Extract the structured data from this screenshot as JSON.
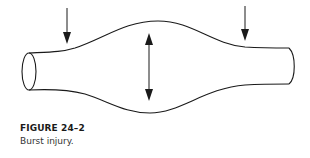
{
  "figure": {
    "label": "FIGURE 24–2",
    "caption": "Burst injury.",
    "illustration": {
      "subject": "tubular vessel with central bulge",
      "arrows": [
        {
          "name": "compression-arrow-left",
          "direction": "down"
        },
        {
          "name": "compression-arrow-right",
          "direction": "down"
        },
        {
          "name": "expansion-arrow-center",
          "direction": "up-down"
        }
      ],
      "stroke_color": "#1a1a1a"
    }
  }
}
